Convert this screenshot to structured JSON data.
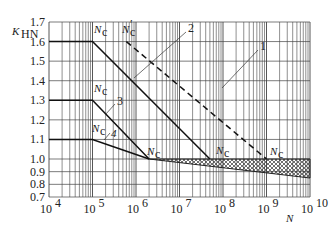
{
  "chart_data": {
    "type": "line",
    "title": "",
    "xlabel": "N",
    "ylabel": "K_HN",
    "x_scale": "log",
    "xlim": [
      10000,
      10000000000
    ],
    "ylim": [
      0.7,
      1.7
    ],
    "grid": true,
    "x_ticks": [
      "10^4",
      "10^5",
      "10^6",
      "10^7",
      "10^8",
      "10^9",
      "10^10"
    ],
    "y_ticks": [
      "1.7",
      "1.6",
      "1.5",
      "1.4",
      "1.3",
      "1.2",
      "1.1",
      "1.0",
      "0.9",
      "0.8",
      "0.7"
    ],
    "series": [
      {
        "name": "1",
        "style": "solid",
        "points": [
          [
            10000,
            1.6
          ],
          [
            100000,
            1.6
          ],
          [
            50000000,
            1.0
          ]
        ]
      },
      {
        "name": "2",
        "style": "dashed",
        "points": [
          [
            600000,
            1.6
          ],
          [
            1000000000,
            1.0
          ]
        ]
      },
      {
        "name": "3",
        "style": "solid",
        "points": [
          [
            10000,
            1.3
          ],
          [
            100000,
            1.3
          ],
          [
            2000000,
            1.0
          ]
        ]
      },
      {
        "name": "4",
        "style": "solid",
        "points": [
          [
            10000,
            1.1
          ],
          [
            100000,
            1.1
          ],
          [
            2000000,
            1.0
          ]
        ]
      }
    ],
    "band": {
      "name": "hatched-region",
      "upper": [
        [
          2000000,
          1.0
        ],
        [
          10000000000,
          1.0
        ]
      ],
      "lower": [
        [
          2000000,
          1.0
        ],
        [
          10000000000,
          0.85
        ]
      ]
    },
    "annotations": [
      {
        "text": "Nc",
        "at": [
          100000,
          1.6
        ]
      },
      {
        "text": "N'c",
        "at": [
          600000,
          1.6
        ]
      },
      {
        "text": "Nc",
        "at": [
          100000,
          1.3
        ]
      },
      {
        "text": "Nc",
        "at": [
          100000,
          1.1
        ]
      },
      {
        "text": "Nc",
        "at": [
          2000000,
          1.0
        ]
      },
      {
        "text": "Nc",
        "at": [
          50000000,
          1.0
        ]
      },
      {
        "text": "Nc",
        "at": [
          1000000000,
          1.0
        ]
      }
    ]
  },
  "labels": {
    "ylabel_main": "K",
    "ylabel_sub": "HN",
    "xlabel": "N",
    "nc_main": "N",
    "nc_sub": "c",
    "prime": "′",
    "curve1": "1",
    "curve2": "2",
    "curve3": "3",
    "curve4": "4",
    "x_base": "10",
    "x_exps": [
      "4",
      "5",
      "6",
      "7",
      "8",
      "9",
      "10"
    ],
    "y_ticks": [
      "1.7",
      "1.6",
      "1.5",
      "1.4",
      "1.3",
      "1.2",
      "1.1",
      "1.0",
      "0.9",
      "0.8",
      "0.7"
    ]
  }
}
